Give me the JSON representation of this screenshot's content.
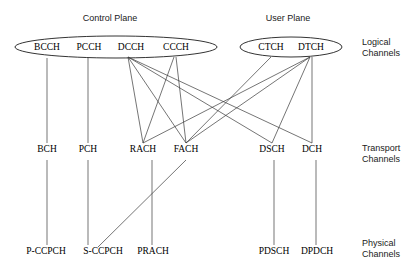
{
  "diagram": {
    "planes": [
      {
        "id": "control-plane",
        "label": "Control Plane",
        "x": 110,
        "y": 18
      },
      {
        "id": "user-plane",
        "label": "User Plane",
        "x": 288,
        "y": 18
      }
    ],
    "row_labels": [
      {
        "id": "logical",
        "line1": "Logical",
        "line2": "Channels",
        "x": 362,
        "y": 42
      },
      {
        "id": "transport",
        "line1": "Transport",
        "line2": "Channels",
        "x": 362,
        "y": 148
      },
      {
        "id": "physical",
        "line1": "Physical",
        "line2": "Channels",
        "x": 362,
        "y": 243
      }
    ],
    "ellipses": [
      {
        "id": "control-plane-ellipse",
        "cx": 116,
        "cy": 47,
        "rx": 101,
        "ry": 11
      },
      {
        "id": "user-plane-ellipse",
        "cx": 291,
        "cy": 47,
        "rx": 51,
        "ry": 10
      }
    ],
    "logical_channels": [
      {
        "id": "BCCH",
        "label": "BCCH",
        "x": 47,
        "y": 50
      },
      {
        "id": "PCCH",
        "label": "PCCH",
        "x": 89,
        "y": 50
      },
      {
        "id": "DCCH",
        "label": "DCCH",
        "x": 131,
        "y": 50
      },
      {
        "id": "CCCH",
        "label": "CCCH",
        "x": 176,
        "y": 50
      },
      {
        "id": "CTCH",
        "label": "CTCH",
        "x": 271,
        "y": 50
      },
      {
        "id": "DTCH",
        "label": "DTCH",
        "x": 311,
        "y": 50
      }
    ],
    "transport_channels": [
      {
        "id": "BCH",
        "label": "BCH",
        "x": 47,
        "y": 152
      },
      {
        "id": "PCH",
        "label": "PCH",
        "x": 88,
        "y": 152
      },
      {
        "id": "RACH",
        "label": "RACH",
        "x": 143,
        "y": 152
      },
      {
        "id": "FACH",
        "label": "FACH",
        "x": 186,
        "y": 152
      },
      {
        "id": "DSCH",
        "label": "DSCH",
        "x": 272,
        "y": 152
      },
      {
        "id": "DCH",
        "label": "DCH",
        "x": 312,
        "y": 152
      }
    ],
    "physical_channels": [
      {
        "id": "P-CCPCH",
        "label": "P-CCPCH",
        "x": 46,
        "y": 254
      },
      {
        "id": "S-CCPCH",
        "label": "S-CCPCH",
        "x": 103,
        "y": 254
      },
      {
        "id": "PRACH",
        "label": "PRACH",
        "x": 153,
        "y": 254
      },
      {
        "id": "PDSCH",
        "label": "PDSCH",
        "x": 274,
        "y": 254
      },
      {
        "id": "DPDCH",
        "label": "DPDCH",
        "x": 317,
        "y": 254
      }
    ],
    "connections_logical_to_transport": [
      {
        "id": "bcch-bch",
        "from": "BCCH",
        "to": "BCH",
        "x1": 47,
        "y1": 58,
        "x2": 47,
        "y2": 143
      },
      {
        "id": "pcch-pch",
        "from": "PCCH",
        "to": "PCH",
        "x1": 88,
        "y1": 58,
        "x2": 88,
        "y2": 143
      },
      {
        "id": "dcch-rach",
        "from": "DCCH",
        "to": "RACH",
        "x1": 128,
        "y1": 57,
        "x2": 143,
        "y2": 143
      },
      {
        "id": "dcch-fach",
        "from": "DCCH",
        "to": "FACH",
        "x1": 128,
        "y1": 57,
        "x2": 186,
        "y2": 143
      },
      {
        "id": "dcch-dsch",
        "from": "DCCH",
        "to": "DSCH",
        "x1": 128,
        "y1": 57,
        "x2": 272,
        "y2": 143
      },
      {
        "id": "dcch-dch",
        "from": "DCCH",
        "to": "DCH",
        "x1": 128,
        "y1": 57,
        "x2": 312,
        "y2": 143
      },
      {
        "id": "ccch-rach",
        "from": "CCCH",
        "to": "RACH",
        "x1": 174,
        "y1": 57,
        "x2": 143,
        "y2": 143
      },
      {
        "id": "ccch-fach",
        "from": "CCCH",
        "to": "FACH",
        "x1": 176,
        "y1": 57,
        "x2": 186,
        "y2": 143
      },
      {
        "id": "ctch-fach",
        "from": "CTCH",
        "to": "FACH",
        "x1": 271,
        "y1": 57,
        "x2": 186,
        "y2": 143
      },
      {
        "id": "dtch-fach",
        "from": "DTCH",
        "to": "FACH",
        "x1": 310,
        "y1": 57,
        "x2": 186,
        "y2": 143
      },
      {
        "id": "dtch-rach",
        "from": "DTCH",
        "to": "RACH",
        "x1": 310,
        "y1": 57,
        "x2": 143,
        "y2": 143
      },
      {
        "id": "dtch-dsch",
        "from": "DTCH",
        "to": "DSCH",
        "x1": 310,
        "y1": 57,
        "x2": 272,
        "y2": 143
      },
      {
        "id": "dtch-dch",
        "from": "DTCH",
        "to": "DCH",
        "x1": 312,
        "y1": 57,
        "x2": 312,
        "y2": 143
      }
    ],
    "connections_transport_to_physical": [
      {
        "id": "bch-pccpch",
        "from": "BCH",
        "to": "P-CCPCH",
        "x1": 47,
        "y1": 160,
        "x2": 47,
        "y2": 245
      },
      {
        "id": "pch-sccpch",
        "from": "PCH",
        "to": "S-CCPCH",
        "x1": 88,
        "y1": 160,
        "x2": 88,
        "y2": 245
      },
      {
        "id": "rach-prach",
        "from": "RACH",
        "to": "PRACH",
        "x1": 152,
        "y1": 160,
        "x2": 152,
        "y2": 245
      },
      {
        "id": "fach-sccpch",
        "from": "FACH",
        "to": "S-CCPCH",
        "x1": 186,
        "y1": 160,
        "x2": 98,
        "y2": 247
      },
      {
        "id": "dsch-pdsch",
        "from": "DSCH",
        "to": "PDSCH",
        "x1": 274,
        "y1": 160,
        "x2": 274,
        "y2": 245
      },
      {
        "id": "dch-dpdch",
        "from": "DCH",
        "to": "DPDCH",
        "x1": 316,
        "y1": 160,
        "x2": 316,
        "y2": 245
      }
    ]
  }
}
